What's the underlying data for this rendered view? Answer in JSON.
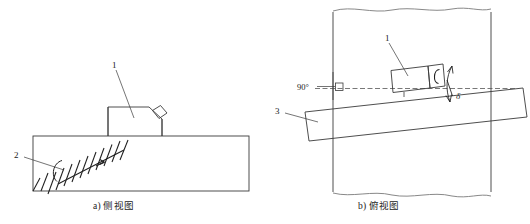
{
  "figure": {
    "title": "",
    "panels": [
      {
        "id": "panel-a",
        "caption": "a) 侧视图",
        "callouts": [
          {
            "id": "callout-1a",
            "label": "1"
          },
          {
            "id": "callout-2a",
            "label": "2"
          }
        ]
      },
      {
        "id": "panel-b",
        "caption": "b) 俯视图",
        "callouts": [
          {
            "id": "callout-1b",
            "label": "1"
          },
          {
            "id": "callout-3b",
            "label": "3"
          }
        ],
        "annotations": [
          {
            "id": "angle-right",
            "label": "90°"
          },
          {
            "id": "angle-delta",
            "label": "δ"
          }
        ]
      }
    ]
  },
  "colors": {
    "stroke": "#3a3a3a",
    "stroke_dark": "#1f1f1f",
    "background": "#ffffff",
    "dashed": "#555555"
  }
}
